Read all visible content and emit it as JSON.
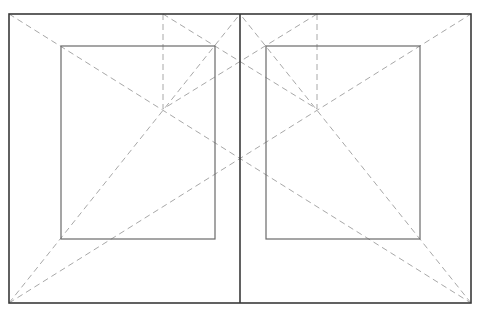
{
  "diagram": {
    "type": "page-layout-canon",
    "colors": {
      "outer": "#3a3a3a",
      "inner": "#6a6a6a",
      "construction": "#a8a8a8",
      "background": "#ffffff"
    },
    "spread": {
      "x1": 9,
      "y1": 14,
      "x2": 471,
      "y2": 303,
      "spine_x": 240
    },
    "text_blocks": [
      {
        "name": "left-text-block",
        "x": 61,
        "y": 46,
        "w": 154,
        "h": 193
      },
      {
        "name": "right-text-block",
        "x": 266,
        "y": 46,
        "w": 154,
        "h": 193
      }
    ],
    "construction_lines": [
      {
        "name": "spread-diagonal-down",
        "x1": 9,
        "y1": 14,
        "x2": 471,
        "y2": 303
      },
      {
        "name": "spread-diagonal-up",
        "x1": 9,
        "y1": 303,
        "x2": 471,
        "y2": 14
      },
      {
        "name": "left-page-diagonal",
        "x1": 9,
        "y1": 303,
        "x2": 240,
        "y2": 14
      },
      {
        "name": "right-page-diagonal",
        "x1": 471,
        "y1": 303,
        "x2": 240,
        "y2": 14
      },
      {
        "name": "left-vertical-guide",
        "x1": 163,
        "y1": 14,
        "x2": 163,
        "y2": 109
      },
      {
        "name": "right-vertical-guide",
        "x1": 317,
        "y1": 14,
        "x2": 317,
        "y2": 109
      },
      {
        "name": "cross-guide-a",
        "x1": 163,
        "y1": 14,
        "x2": 317,
        "y2": 109
      },
      {
        "name": "cross-guide-b",
        "x1": 317,
        "y1": 14,
        "x2": 163,
        "y2": 109
      }
    ]
  }
}
